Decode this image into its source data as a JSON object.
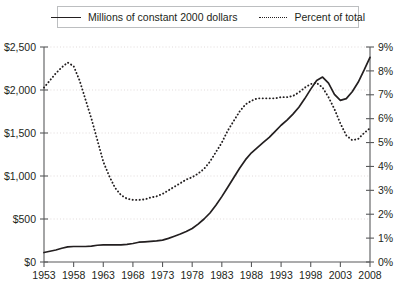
{
  "legend": {
    "entries": [
      {
        "label": "Millions of constant 2000 dollars",
        "style": "solid"
      },
      {
        "label": "Percent of total",
        "style": "dotted"
      }
    ]
  },
  "chart_data": {
    "type": "line",
    "title": "",
    "xlabel": "",
    "ylabel": "",
    "grid": true,
    "legend_position": "top",
    "x": [
      1953,
      1954,
      1955,
      1956,
      1957,
      1958,
      1959,
      1960,
      1961,
      1962,
      1963,
      1964,
      1965,
      1966,
      1967,
      1968,
      1969,
      1970,
      1971,
      1972,
      1973,
      1974,
      1975,
      1976,
      1977,
      1978,
      1979,
      1980,
      1981,
      1982,
      1983,
      1984,
      1985,
      1986,
      1987,
      1988,
      1989,
      1990,
      1991,
      1992,
      1993,
      1994,
      1995,
      1996,
      1997,
      1998,
      1999,
      2000,
      2001,
      2002,
      2003,
      2004,
      2005,
      2006,
      2007,
      2008
    ],
    "xticks": [
      1953,
      1958,
      1963,
      1968,
      1973,
      1978,
      1983,
      1988,
      1993,
      1998,
      2003,
      2008
    ],
    "xtick_labels": [
      "1953",
      "1958",
      "1963",
      "1968",
      "1973",
      "1978",
      "1983",
      "1988",
      "1993",
      "1998",
      "2003",
      "2008"
    ],
    "xlim": [
      1953,
      2008
    ],
    "left_axis": {
      "label": "Millions of constant 2000 dollars",
      "ylim": [
        0,
        2500
      ],
      "ticks": [
        0,
        500,
        1000,
        1500,
        2000,
        2500
      ],
      "tick_labels": [
        "$0",
        "$500",
        "$1,000",
        "$1,500",
        "$2,000",
        "$2,500"
      ]
    },
    "right_axis": {
      "label": "Percent of total",
      "ylim": [
        0,
        9
      ],
      "ticks": [
        0,
        1,
        2,
        3,
        4,
        5,
        6,
        7,
        8,
        9
      ],
      "tick_labels": [
        "0%",
        "1%",
        "2%",
        "3%",
        "4%",
        "5%",
        "6%",
        "7%",
        "8%",
        "9%"
      ]
    },
    "series": [
      {
        "name": "Millions of constant 2000 dollars",
        "axis": "left",
        "style": "solid",
        "color": "#231f20",
        "values": [
          110,
          125,
          140,
          160,
          175,
          180,
          180,
          180,
          185,
          195,
          200,
          200,
          200,
          200,
          205,
          215,
          230,
          235,
          240,
          245,
          255,
          275,
          300,
          325,
          355,
          390,
          440,
          500,
          570,
          660,
          760,
          870,
          980,
          1090,
          1190,
          1270,
          1330,
          1390,
          1450,
          1520,
          1590,
          1650,
          1720,
          1800,
          1900,
          2010,
          2110,
          2150,
          2080,
          1950,
          1880,
          1900,
          1980,
          2090,
          2230,
          2380
        ]
      },
      {
        "name": "Percent of total",
        "axis": "right",
        "style": "dotted",
        "color": "#231f20",
        "values": [
          7.3,
          7.6,
          7.9,
          8.15,
          8.35,
          8.2,
          7.6,
          6.8,
          6.0,
          5.1,
          4.2,
          3.6,
          3.1,
          2.8,
          2.65,
          2.6,
          2.6,
          2.62,
          2.7,
          2.75,
          2.85,
          3.0,
          3.15,
          3.3,
          3.45,
          3.55,
          3.7,
          3.9,
          4.2,
          4.6,
          5.0,
          5.5,
          5.9,
          6.3,
          6.6,
          6.75,
          6.85,
          6.85,
          6.85,
          6.85,
          6.9,
          6.9,
          6.95,
          7.1,
          7.3,
          7.45,
          7.5,
          7.3,
          6.9,
          6.4,
          5.8,
          5.3,
          5.1,
          5.15,
          5.4,
          5.6
        ]
      }
    ]
  }
}
